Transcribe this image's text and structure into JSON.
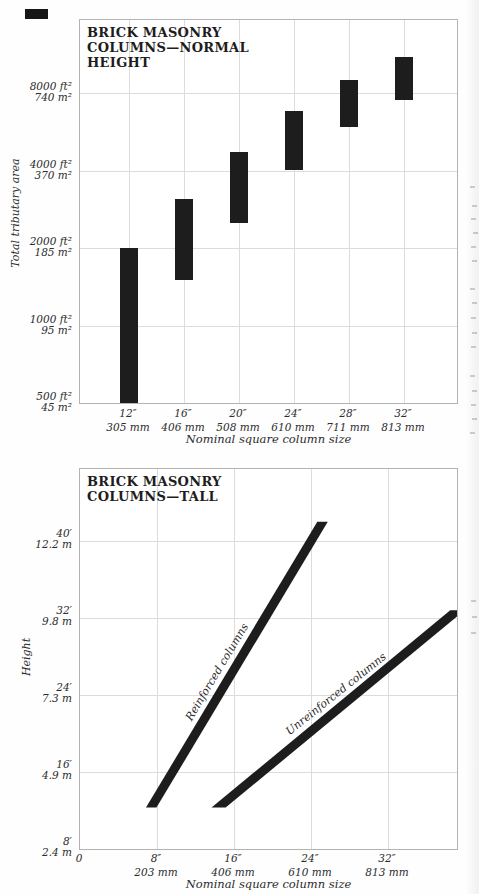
{
  "colors": {
    "ink": "#1d1d1d",
    "grid": "#dcdcdc",
    "frame": "#b3b3b3",
    "ghost": "#cfcfcf",
    "paper": "#fefefe"
  },
  "chart_data": [
    {
      "type": "bar",
      "title": "BRICK MASONRY COLUMNS—NORMAL HEIGHT",
      "title_lines": [
        "BRICK MASONRY",
        "COLUMNS—NORMAL",
        "HEIGHT"
      ],
      "xlabel": "Nominal square column size",
      "ylabel": "Total tributary area",
      "y_scale": "log2",
      "ylim_ft2": [
        500,
        16000
      ],
      "grid": true,
      "y_ticks": [
        {
          "ft2": "8000 ft²",
          "m2": "740 m²",
          "value": 8000
        },
        {
          "ft2": "4000 ft²",
          "m2": "370 m²",
          "value": 4000
        },
        {
          "ft2": "2000 ft²",
          "m2": "185 m²",
          "value": 2000
        },
        {
          "ft2": "1000 ft²",
          "m2": "95 m²",
          "value": 1000
        },
        {
          "ft2": "500 ft²",
          "m2": "45 m²",
          "value": 500
        }
      ],
      "x_ticks": [
        {
          "inches": "12″",
          "mm": "305 mm",
          "size_in": 12
        },
        {
          "inches": "16″",
          "mm": "406 mm",
          "size_in": 16
        },
        {
          "inches": "20″",
          "mm": "508 mm",
          "size_in": 20
        },
        {
          "inches": "24″",
          "mm": "610 mm",
          "size_in": 24
        },
        {
          "inches": "28″",
          "mm": "711 mm",
          "size_in": 28
        },
        {
          "inches": "32″",
          "mm": "813 mm",
          "size_in": 32
        }
      ],
      "bars": [
        {
          "size_in": 12,
          "area_ft2_min": 500,
          "area_ft2_max": 2000
        },
        {
          "size_in": 16,
          "area_ft2_min": 1500,
          "area_ft2_max": 3100
        },
        {
          "size_in": 20,
          "area_ft2_min": 2500,
          "area_ft2_max": 4700
        },
        {
          "size_in": 24,
          "area_ft2_min": 4000,
          "area_ft2_max": 6800
        },
        {
          "size_in": 28,
          "area_ft2_min": 5900,
          "area_ft2_max": 9000
        },
        {
          "size_in": 32,
          "area_ft2_min": 7500,
          "area_ft2_max": 11000
        }
      ]
    },
    {
      "type": "line",
      "title": "BRICK MASONRY COLUMNS—TALL",
      "title_lines": [
        "BRICK MASONRY",
        "COLUMNS—TALL"
      ],
      "xlabel": "Nominal square column size",
      "ylabel": "Height",
      "xlim_in": [
        0,
        39.4
      ],
      "ylim_ft": [
        8,
        48
      ],
      "grid": true,
      "y_ticks": [
        {
          "ft": "40′",
          "m": "12.2 m",
          "value": 40
        },
        {
          "ft": "32′",
          "m": "9.8 m",
          "value": 32
        },
        {
          "ft": "24′",
          "m": "7.3 m",
          "value": 24
        },
        {
          "ft": "16′",
          "m": "4.9 m",
          "value": 16
        },
        {
          "ft": "8′",
          "m": "2.4 m",
          "value": 8
        }
      ],
      "x_ticks": [
        {
          "inches": "0",
          "mm": "",
          "size_in": 0
        },
        {
          "inches": "8″",
          "mm": "203 mm",
          "size_in": 8
        },
        {
          "inches": "16″",
          "mm": "406 mm",
          "size_in": 16
        },
        {
          "inches": "24″",
          "mm": "610 mm",
          "size_in": 24
        },
        {
          "inches": "32″",
          "mm": "813 mm",
          "size_in": 32
        }
      ],
      "series": [
        {
          "name": "Reinforced columns",
          "points_in_ft": [
            [
              7.4,
              12.3
            ],
            [
              25.2,
              42.0
            ]
          ],
          "label_pos_in_ft": [
            14.2,
            26.4
          ],
          "label_angle_deg": -59
        },
        {
          "name": "Unreinforced columns",
          "points_in_ft": [
            [
              14.4,
              12.3
            ],
            [
              39.2,
              32.8
            ]
          ],
          "label_pos_in_ft": [
            26.6,
            24.1
          ],
          "label_angle_deg": -38.5
        }
      ]
    }
  ],
  "artifacts": {
    "ghost_mark_positions": [
      [
        470,
        186
      ],
      [
        472,
        205
      ],
      [
        471,
        218
      ],
      [
        473,
        232
      ],
      [
        471,
        246
      ],
      [
        472,
        260
      ],
      [
        470,
        288
      ],
      [
        472,
        302
      ],
      [
        471,
        317
      ],
      [
        472,
        332
      ],
      [
        471,
        346
      ],
      [
        470,
        375
      ],
      [
        472,
        390
      ],
      [
        471,
        404
      ],
      [
        472,
        418
      ],
      [
        470,
        432
      ],
      [
        471,
        600
      ],
      [
        472,
        616
      ],
      [
        471,
        632
      ]
    ]
  }
}
